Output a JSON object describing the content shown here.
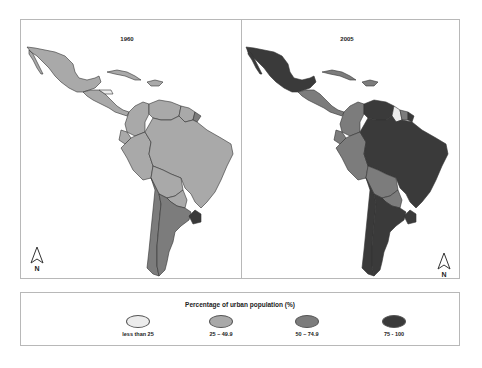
{
  "maps": [
    {
      "title": "1960",
      "north_label": "N",
      "regions": {
        "mexico": "25 - 49.9",
        "central_america": "25 - 49.9",
        "caribbean": "25 - 49.9",
        "venezuela": "25 - 49.9",
        "colombia": "25 - 49.9",
        "guianas": "25 - 49.9",
        "french_guiana": "50 - 74.9",
        "ecuador": "25 - 49.9",
        "peru": "25 - 49.9",
        "bolivia": "25 - 49.9",
        "brazil": "25 - 49.9",
        "paraguay": "25 - 49.9",
        "chile": "50 - 74.9",
        "argentina": "50 - 74.9",
        "uruguay": "75 - 100"
      }
    },
    {
      "title": "2005",
      "north_label": "N",
      "regions": {
        "mexico": "75 - 100",
        "central_america": "50 - 74.9",
        "caribbean": "50 - 74.9",
        "venezuela": "75 - 100",
        "colombia": "50 - 74.9",
        "guyana": "less than 25",
        "suriname": "50 - 74.9",
        "french_guiana": "75 - 100",
        "ecuador": "50 - 74.9",
        "peru": "50 - 74.9",
        "bolivia": "50 - 74.9",
        "brazil": "75 - 100",
        "paraguay": "50 - 74.9",
        "chile": "75 - 100",
        "argentina": "75 - 100",
        "uruguay": "75 - 100"
      }
    }
  ],
  "legend": {
    "title": "Percentage of urban population (%)",
    "items": [
      {
        "label": "less than 25",
        "color": "#ececec"
      },
      {
        "label": "25 – 49.9",
        "color": "#a9a9a9"
      },
      {
        "label": "50 – 74.9",
        "color": "#7c7c7c"
      },
      {
        "label": "75 - 100",
        "color": "#3a3a3a"
      }
    ]
  },
  "colors": {
    "frame": "#b8b8b8",
    "border": "#333333"
  }
}
